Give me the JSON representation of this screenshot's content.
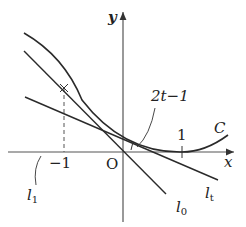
{
  "diagram": {
    "axes": {
      "x_label": "x",
      "y_label": "y",
      "origin_label": "O",
      "ticks": [
        {
          "value": -1,
          "label": "−1"
        },
        {
          "value": 1,
          "label": "1"
        }
      ]
    },
    "curve": {
      "name": "C",
      "label": "C"
    },
    "lines": [
      {
        "name": "l0",
        "letter": "l",
        "sub": "0"
      },
      {
        "name": "lt",
        "letter": "l",
        "sub": "t"
      },
      {
        "name": "l1",
        "letter": "l",
        "sub": "1"
      }
    ],
    "annotation": {
      "label": "2t−1"
    },
    "colors": {
      "stroke": "#2a2a2a",
      "axis": "#555555",
      "background": "#ffffff"
    }
  }
}
